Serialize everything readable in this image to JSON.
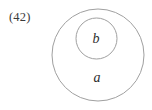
{
  "figure": {
    "number_label": "(42)",
    "background_color": "#ffffff",
    "stroke_color": "#a0a0a0",
    "text_color": "#2e2e2e",
    "number_color": "#3a3a3a"
  },
  "diagram": {
    "type": "euler-diagram",
    "outer_set": {
      "label": "a",
      "center_x": 98,
      "center_y": 55,
      "radius": 46
    },
    "inner_set": {
      "label": "b",
      "center_x": 96.5,
      "center_y": 38.5,
      "radius": 20.5
    }
  }
}
